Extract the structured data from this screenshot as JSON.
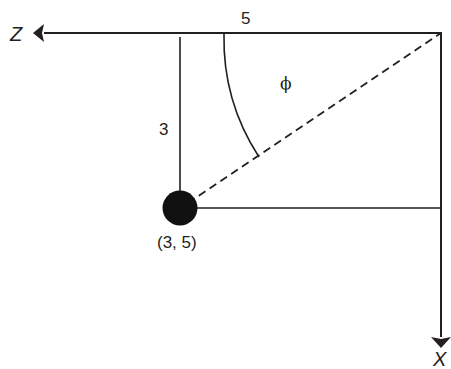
{
  "diagram": {
    "type": "geometry",
    "axes": {
      "horizontal": {
        "label": "Z",
        "direction": "left"
      },
      "vertical": {
        "label": "X",
        "direction": "down"
      }
    },
    "labels": {
      "top_length": "5",
      "side_length": "3",
      "angle": "ϕ",
      "point": "(3, 5)"
    },
    "point": {
      "label": "(3, 5)",
      "style": "filled-circle"
    },
    "colors": {
      "line": "#231f20",
      "background": "#ffffff"
    }
  }
}
